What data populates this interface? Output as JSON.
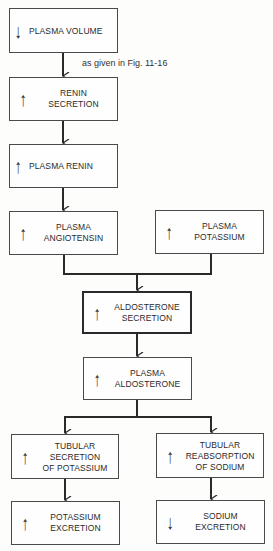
{
  "diagram": {
    "note": "as given in Fig. 11-16",
    "boxes": [
      {
        "id": "plasma-volume",
        "label": "PLASMA VOLUME",
        "direction": "down",
        "x": 9,
        "y": 8,
        "w": 109,
        "h": 45,
        "thick": false
      },
      {
        "id": "renin-secretion",
        "label": "RENIN\nSECRETION",
        "direction": "up",
        "x": 9,
        "y": 77,
        "w": 109,
        "h": 44,
        "thick": false
      },
      {
        "id": "plasma-renin",
        "label": "PLASMA RENIN",
        "direction": "up",
        "x": 9,
        "y": 144,
        "w": 109,
        "h": 44,
        "thick": false
      },
      {
        "id": "plasma-angiotensin",
        "label": "PLASMA\nANGIOTENSIN",
        "direction": "up",
        "x": 9,
        "y": 211,
        "w": 109,
        "h": 44,
        "thick": false
      },
      {
        "id": "plasma-potassium",
        "label": "PLASMA\nPOTASSIUM",
        "direction": "up",
        "x": 155,
        "y": 210,
        "w": 109,
        "h": 44,
        "thick": false
      },
      {
        "id": "aldosterone-secretion",
        "label": "ALDOSTERONE\nSECRETION",
        "direction": "up",
        "x": 82,
        "y": 291,
        "w": 110,
        "h": 43,
        "thick": true
      },
      {
        "id": "plasma-aldosterone",
        "label": "PLASMA\nALDOSTERONE",
        "direction": "up",
        "x": 83,
        "y": 357,
        "w": 109,
        "h": 43,
        "thick": false
      },
      {
        "id": "tubular-secretion-potassium",
        "label": "TUBULAR\nSECRETION\nOF POTASSIUM",
        "direction": "up",
        "x": 11,
        "y": 434,
        "w": 108,
        "h": 45,
        "thick": false
      },
      {
        "id": "tubular-reabsorption-sodium",
        "label": "TUBULAR\nREABSORPTION\nOF SODIUM",
        "direction": "up",
        "x": 156,
        "y": 433,
        "w": 108,
        "h": 45,
        "thick": false
      },
      {
        "id": "potassium-excretion",
        "label": "POTASSIUM\nEXCRETION",
        "direction": "up",
        "x": 11,
        "y": 501,
        "w": 109,
        "h": 44,
        "thick": false
      },
      {
        "id": "sodium-excretion",
        "label": "SODIUM\nEXCRETION",
        "direction": "down",
        "x": 156,
        "y": 500,
        "w": 109,
        "h": 44,
        "thick": false
      }
    ],
    "arrow_symbols": {
      "up": "↑",
      "down": "↓"
    }
  }
}
